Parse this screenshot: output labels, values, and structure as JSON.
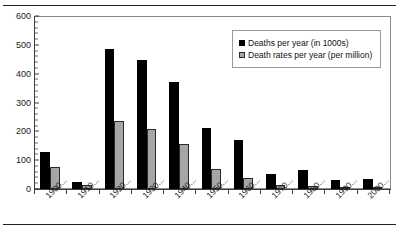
{
  "chart_data": {
    "type": "bar",
    "title": "",
    "xlabel": "",
    "ylabel": "",
    "ylim": [
      0,
      600
    ],
    "yticks": [
      0,
      100,
      200,
      300,
      400,
      500,
      600
    ],
    "ytick_labels": [
      "0",
      "100",
      "200",
      "300",
      "400",
      "500",
      "600"
    ],
    "grid": false,
    "legend_position": "top-right",
    "categories": [
      "1900...",
      "1910...",
      "1920...",
      "1930...",
      "1940...",
      "1950...",
      "1960...",
      "1970...",
      "1980...",
      "1990...",
      "2000..."
    ],
    "series": [
      {
        "name": "Deaths per year (in 1000s)",
        "color": "#000000",
        "values": [
          130,
          25,
          487,
          447,
          372,
          211,
          170,
          52,
          66,
          30,
          36
        ]
      },
      {
        "name": "Death rates per year (per million)",
        "color": "#a6a6a6",
        "values": [
          76,
          13,
          237,
          207,
          156,
          68,
          37,
          13,
          12,
          5,
          6
        ]
      }
    ]
  },
  "legend": {
    "entries": [
      {
        "label": "Deaths per year (in 1000s)",
        "marker": "black-square-swatch"
      },
      {
        "label": "Death rates per year (per million)",
        "marker": "gray-square-swatch"
      }
    ]
  }
}
